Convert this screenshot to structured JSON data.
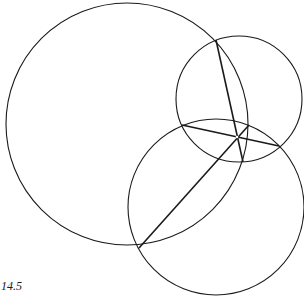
{
  "figure": {
    "caption": "14.5",
    "stroke_color": "#1a1a1a",
    "background": "#ffffff"
  },
  "circles": [
    {
      "name": "large-circle",
      "cx": 127,
      "cy": 124,
      "r": 121
    },
    {
      "name": "small-circle",
      "cx": 239,
      "cy": 99,
      "r": 63
    },
    {
      "name": "bottom-circle",
      "cx": 216,
      "cy": 207,
      "r": 88
    }
  ],
  "chords": [
    {
      "name": "chord-large-small",
      "x1": 216,
      "y1": 40,
      "x2": 243,
      "y2": 162
    },
    {
      "name": "chord-small-bottom",
      "x1": 182,
      "y1": 125,
      "x2": 279,
      "y2": 146
    },
    {
      "name": "chord-large-bottom",
      "x1": 139,
      "y1": 248,
      "x2": 249,
      "y2": 125
    }
  ],
  "radical_center": {
    "x": 237,
    "y": 137
  }
}
